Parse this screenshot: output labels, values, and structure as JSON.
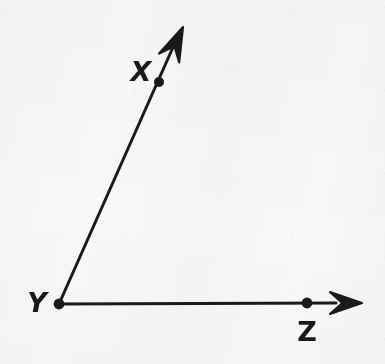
{
  "figure": {
    "kind": "geometry-angle-diagram",
    "width": 385,
    "height": 364,
    "background_color": "#f8f8f7",
    "ink_color": "#1a1a1a",
    "stroke_width": 3
  },
  "points": [
    {
      "id": "x",
      "label": "X",
      "cx": 159,
      "cy": 82,
      "radius": 5.0,
      "label_x": 141,
      "label_y": 71,
      "label_style": "slanted",
      "font_size": 27
    },
    {
      "id": "y",
      "label": "Y",
      "cx": 59,
      "cy": 304,
      "radius": 5.4,
      "label_x": 37,
      "label_y": 302,
      "label_style": "slanted",
      "font_size": 27
    },
    {
      "id": "z",
      "label": "Z",
      "cx": 307,
      "cy": 303,
      "radius": 5.4,
      "label_x": 307,
      "label_y": 331,
      "label_style": "upright",
      "font_size": 27
    }
  ],
  "rays": [
    {
      "id": "ray-yx",
      "name": "ray-y-through-x",
      "from": "y",
      "through": "x",
      "start_x": 59,
      "start_y": 304,
      "end_x": 178,
      "end_y": 36,
      "arrow_tip_x": 183,
      "arrow_tip_y": 27
    },
    {
      "id": "ray-yz",
      "name": "ray-y-through-z",
      "from": "y",
      "through": "z",
      "start_x": 59,
      "start_y": 304,
      "end_x": 336,
      "end_y": 303,
      "arrow_tip_x": 362,
      "arrow_tip_y": 303
    }
  ],
  "arrowheads": [
    {
      "id": "arrow-x",
      "for_ray": "ray-yx",
      "tip_x": 183,
      "tip_y": 27,
      "angle_deg": -66,
      "length": 34,
      "half_width": 11
    },
    {
      "id": "arrow-z",
      "for_ray": "ray-yz",
      "tip_x": 362,
      "tip_y": 303,
      "angle_deg": 0,
      "length": 32,
      "half_width": 11
    }
  ]
}
